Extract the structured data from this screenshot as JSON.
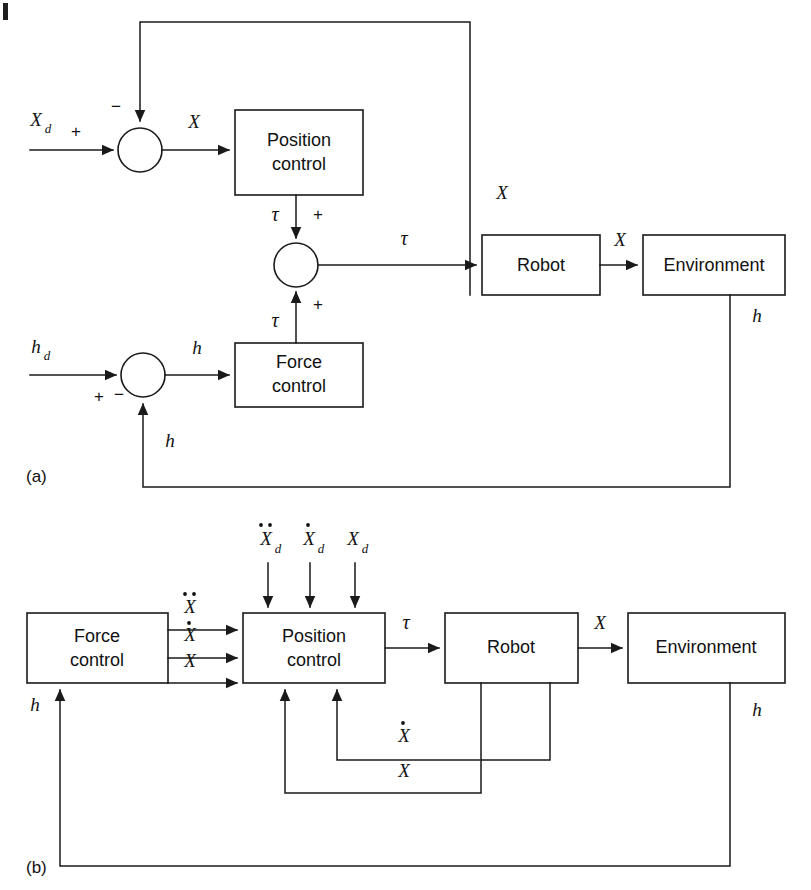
{
  "figure": {
    "type": "control-block-diagram",
    "panels": [
      {
        "id": "a",
        "label": "(a)",
        "description": "Parallel force/position control: position loop and force loop summed at torque level",
        "blocks": [
          {
            "name": "position-control",
            "line1": "Position",
            "line2": "control"
          },
          {
            "name": "force-control",
            "line1": "Force",
            "line2": "control"
          },
          {
            "name": "robot",
            "line1": "Robot",
            "line2": ""
          },
          {
            "name": "environment",
            "line1": "Environment",
            "line2": ""
          }
        ],
        "summing_junctions": [
          {
            "name": "position-error-sum",
            "inputs": [
              "+",
              "-"
            ]
          },
          {
            "name": "torque-sum",
            "inputs": [
              "+",
              "+"
            ]
          },
          {
            "name": "force-error-sum",
            "inputs": [
              "+",
              "-"
            ]
          }
        ],
        "signals": {
          "xd": "X",
          "xd_sub": "d",
          "x": "X",
          "tau": "τ",
          "hd": "h",
          "hd_sub": "d",
          "h": "h"
        }
      },
      {
        "id": "b",
        "label": "(b)",
        "description": "Inner position control loop driven by force control with acceleration, velocity and position commands",
        "blocks": [
          {
            "name": "force-control",
            "line1": "Force",
            "line2": "control"
          },
          {
            "name": "position-control",
            "line1": "Position",
            "line2": "control"
          },
          {
            "name": "robot",
            "line1": "Robot",
            "line2": ""
          },
          {
            "name": "environment",
            "line1": "Environment",
            "line2": ""
          }
        ],
        "reference_inputs": [
          {
            "name": "accel-ref",
            "base": "X",
            "sub": "d",
            "dots": 2
          },
          {
            "name": "vel-ref",
            "base": "X",
            "sub": "d",
            "dots": 1
          },
          {
            "name": "pos-ref",
            "base": "X",
            "sub": "d",
            "dots": 0
          }
        ],
        "interconnect_signals": [
          {
            "name": "accel-cmd",
            "base": "X",
            "dots": 2
          },
          {
            "name": "vel-cmd",
            "base": "X",
            "dots": 1
          },
          {
            "name": "pos-cmd",
            "base": "X",
            "dots": 0
          }
        ],
        "signals": {
          "tau": "τ",
          "x": "X",
          "h": "h",
          "xdot": "X"
        }
      }
    ],
    "colors": {
      "stroke": "#1a1a1a",
      "background": "#ffffff",
      "text": "#111111"
    }
  }
}
